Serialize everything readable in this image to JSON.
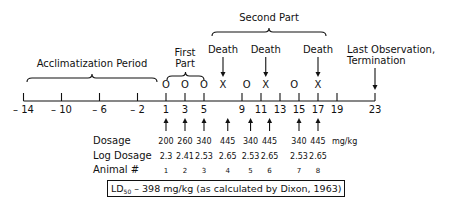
{
  "diagram": {
    "type": "timeline",
    "axis": {
      "ticks": [
        -14,
        -10,
        -6,
        -2,
        1,
        3,
        5,
        9,
        11,
        13,
        15,
        17,
        19,
        23
      ],
      "tick_labels": [
        "– 14",
        "– 10",
        "– 6",
        "– 2",
        "1",
        "3",
        "5",
        "9",
        "11",
        "13",
        "15",
        "17",
        "19",
        "23"
      ]
    },
    "periods": [
      {
        "label": "Acclimatization Period",
        "from": -14,
        "to": 0
      },
      {
        "label_line1": "First",
        "label_line2": "Part",
        "from": 1,
        "to": 5
      },
      {
        "label": "Second Part",
        "from": 7,
        "to": 17
      }
    ],
    "outcomes": [
      {
        "day": 1,
        "symbol": "O"
      },
      {
        "day": 3,
        "symbol": "O"
      },
      {
        "day": 5,
        "symbol": "O"
      },
      {
        "day": 7,
        "symbol": "X",
        "annotation": "Death"
      },
      {
        "day": 9.5,
        "symbol": "O"
      },
      {
        "day": 11.5,
        "symbol": "X",
        "annotation": "Death"
      },
      {
        "day": 14.5,
        "symbol": "O"
      },
      {
        "day": 17,
        "symbol": "X",
        "annotation": "Death"
      }
    ],
    "termination": {
      "day": 23,
      "line1": "Last Observation,",
      "line2": "Termination"
    },
    "dosing": {
      "row_labels": {
        "dosage": "Dosage",
        "log_dosage": "Log Dosage",
        "animal": "Animal #"
      },
      "unit": "mg/kg",
      "entries": [
        {
          "day": 1,
          "dosage": "200",
          "log": "2.3",
          "animal": "1"
        },
        {
          "day": 3,
          "dosage": "260",
          "log": "2.41",
          "animal": "2"
        },
        {
          "day": 5,
          "dosage": "340",
          "log": "2.53",
          "animal": "3"
        },
        {
          "day": 7.5,
          "dosage": "445",
          "log": "2.65",
          "animal": "4"
        },
        {
          "day": 9.9,
          "dosage": "340",
          "log": "2.53",
          "animal": "5"
        },
        {
          "day": 11.9,
          "dosage": "445",
          "log": "2.65",
          "animal": "6"
        },
        {
          "day": 15,
          "dosage": "340",
          "log": "2.53",
          "animal": "7"
        },
        {
          "day": 17,
          "dosage": "445",
          "log": "2.65",
          "animal": "8"
        }
      ]
    },
    "result": {
      "prefix": "LD",
      "subscript": "50",
      "text": " – 398 mg/kg (as calculated by Dixon, 1963)"
    }
  }
}
